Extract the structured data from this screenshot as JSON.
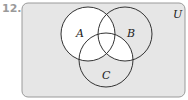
{
  "problem_number": "12.",
  "universe_label": "U",
  "sets": [
    {
      "id": "A",
      "label": "A"
    },
    {
      "id": "B",
      "label": "B"
    },
    {
      "id": "C",
      "label": "C"
    }
  ],
  "shaded_region_description": "A ∪ (B ∩ C) unshaded (white); remaining regions of U shaded gray",
  "colors": {
    "background_shade": "#e6e6e6",
    "highlight": "#ffffff",
    "outline": "#333333",
    "number": "#9a9a9a"
  }
}
